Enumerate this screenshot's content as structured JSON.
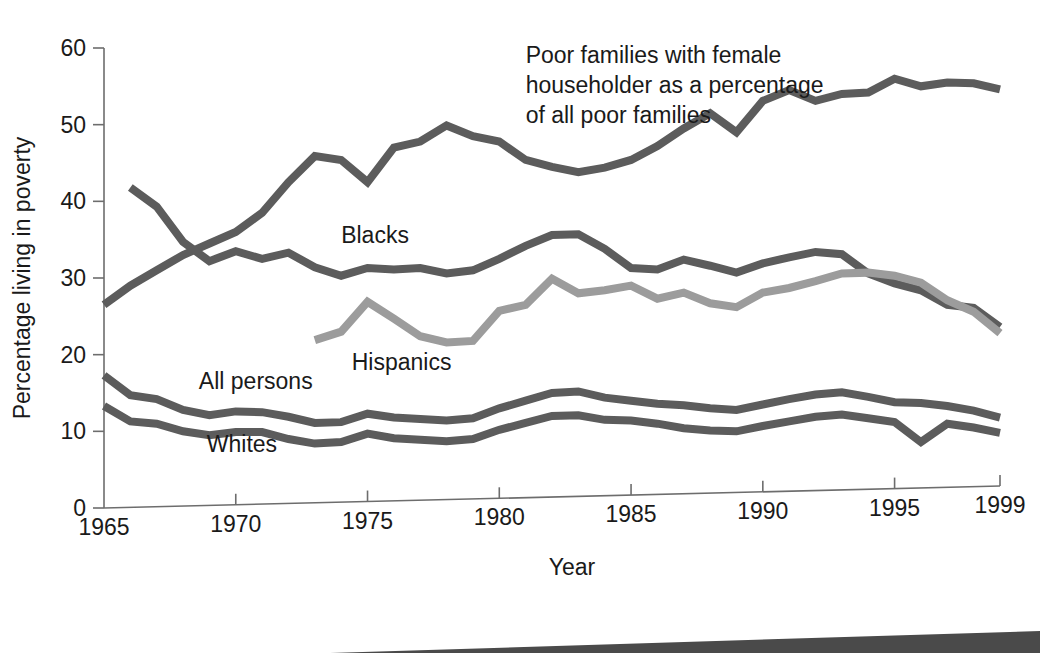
{
  "chart_data": {
    "type": "line",
    "title": "",
    "xlabel": "Year",
    "ylabel": "Percentage living in poverty",
    "xlim": [
      1965,
      1999
    ],
    "ylim": [
      0,
      60
    ],
    "xticks": [
      1965,
      1970,
      1975,
      1980,
      1985,
      1990,
      1995,
      1999
    ],
    "xtick_labels": [
      "1965",
      "1970",
      "1975",
      "1980",
      "1985",
      "1990",
      "1995",
      "1999"
    ],
    "yticks": [
      0,
      10,
      20,
      30,
      40,
      50,
      60
    ],
    "ytick_labels": [
      "0",
      "10",
      "20",
      "30",
      "40",
      "50",
      "60"
    ],
    "grid": false,
    "legend_position": "inline-labels",
    "annotations": [
      {
        "name": "female-householder-annotation",
        "lines": [
          "Poor families with female",
          "householder as a percentage",
          "of all poor families"
        ],
        "x": 1981.0,
        "y": 58.0
      }
    ],
    "series": [
      {
        "name": "Poor families with female householder as a percentage of all poor families",
        "label": "",
        "color": "#5c5c5c",
        "label_x": null,
        "label_y": null,
        "x": [
          1965,
          1966,
          1967,
          1968,
          1969,
          1970,
          1971,
          1972,
          1973,
          1974,
          1975,
          1976,
          1977,
          1978,
          1979,
          1980,
          1981,
          1982,
          1983,
          1984,
          1985,
          1986,
          1987,
          1988,
          1989,
          1990,
          1991,
          1992,
          1993,
          1994,
          1995,
          1996,
          1997,
          1998,
          1999
        ],
        "values": [
          26.5,
          29.0,
          31.0,
          33.0,
          34.5,
          36.0,
          38.5,
          42.5,
          45.9,
          45.4,
          42.5,
          47.0,
          47.8,
          49.9,
          48.5,
          47.8,
          45.4,
          44.5,
          43.8,
          44.4,
          45.4,
          47.2,
          49.5,
          51.5,
          49.0,
          53.1,
          54.5,
          53.1,
          54.0,
          54.2,
          56.0,
          55.0,
          55.5,
          55.4,
          54.6
        ]
      },
      {
        "name": "Blacks",
        "label": "Blacks",
        "color": "#5c5c5c",
        "label_x": 1974.0,
        "label_y": 35.6,
        "x": [
          1966,
          1967,
          1968,
          1969,
          1970,
          1971,
          1972,
          1973,
          1974,
          1975,
          1976,
          1977,
          1978,
          1979,
          1980,
          1981,
          1982,
          1983,
          1984,
          1985,
          1986,
          1987,
          1988,
          1989,
          1990,
          1991,
          1992,
          1993,
          1994,
          1995,
          1996,
          1997,
          1998,
          1999
        ],
        "values": [
          41.8,
          39.3,
          34.7,
          32.2,
          33.5,
          32.5,
          33.3,
          31.4,
          30.3,
          31.3,
          31.1,
          31.3,
          30.6,
          31.0,
          32.5,
          34.2,
          35.6,
          35.7,
          33.8,
          31.3,
          31.1,
          32.4,
          31.6,
          30.7,
          31.9,
          32.7,
          33.4,
          33.1,
          30.6,
          29.3,
          28.4,
          26.5,
          26.1,
          23.6
        ]
      },
      {
        "name": "Hispanics",
        "label": "Hispanics",
        "color": "#9c9c9c",
        "label_x": 1974.4,
        "label_y": 19.0,
        "x": [
          1973,
          1974,
          1975,
          1976,
          1977,
          1978,
          1979,
          1980,
          1981,
          1982,
          1983,
          1984,
          1985,
          1986,
          1987,
          1988,
          1989,
          1990,
          1991,
          1992,
          1993,
          1994,
          1995,
          1996,
          1997,
          1998,
          1999
        ],
        "values": [
          21.9,
          23.0,
          26.9,
          24.7,
          22.4,
          21.6,
          21.8,
          25.7,
          26.5,
          29.9,
          28.0,
          28.4,
          29.0,
          27.3,
          28.1,
          26.7,
          26.2,
          28.1,
          28.7,
          29.6,
          30.6,
          30.7,
          30.3,
          29.4,
          27.1,
          25.6,
          22.8
        ]
      },
      {
        "name": "All persons",
        "label": "All persons",
        "color": "#5c5c5c",
        "label_x": 1968.6,
        "label_y": 16.6,
        "x": [
          1965,
          1966,
          1967,
          1968,
          1969,
          1970,
          1971,
          1972,
          1973,
          1974,
          1975,
          1976,
          1977,
          1978,
          1979,
          1980,
          1981,
          1982,
          1983,
          1984,
          1985,
          1986,
          1987,
          1988,
          1989,
          1990,
          1991,
          1992,
          1993,
          1994,
          1995,
          1996,
          1997,
          1998,
          1999
        ],
        "values": [
          17.3,
          14.7,
          14.2,
          12.8,
          12.1,
          12.6,
          12.5,
          11.9,
          11.1,
          11.2,
          12.3,
          11.8,
          11.6,
          11.4,
          11.7,
          13.0,
          14.0,
          15.0,
          15.2,
          14.4,
          14.0,
          13.6,
          13.4,
          13.0,
          12.8,
          13.5,
          14.2,
          14.8,
          15.1,
          14.5,
          13.8,
          13.7,
          13.3,
          12.7,
          11.8
        ]
      },
      {
        "name": "Whites",
        "label": "Whites",
        "color": "#5c5c5c",
        "label_x": 1968.9,
        "label_y": 8.4,
        "x": [
          1965,
          1966,
          1967,
          1968,
          1969,
          1970,
          1971,
          1972,
          1973,
          1974,
          1975,
          1976,
          1977,
          1978,
          1979,
          1980,
          1981,
          1982,
          1983,
          1984,
          1985,
          1986,
          1987,
          1988,
          1989,
          1990,
          1991,
          1992,
          1993,
          1994,
          1995,
          1996,
          1997,
          1998,
          1999
        ],
        "values": [
          13.3,
          11.3,
          11.0,
          10.0,
          9.5,
          9.9,
          9.9,
          9.0,
          8.4,
          8.6,
          9.7,
          9.1,
          8.9,
          8.7,
          9.0,
          10.2,
          11.1,
          12.0,
          12.1,
          11.5,
          11.4,
          11.0,
          10.4,
          10.1,
          10.0,
          10.7,
          11.3,
          11.9,
          12.2,
          11.7,
          11.2,
          8.6,
          11.0,
          10.5,
          9.8
        ]
      }
    ]
  },
  "decor": {
    "bottom_wedge_color": "#4a4a4a"
  }
}
